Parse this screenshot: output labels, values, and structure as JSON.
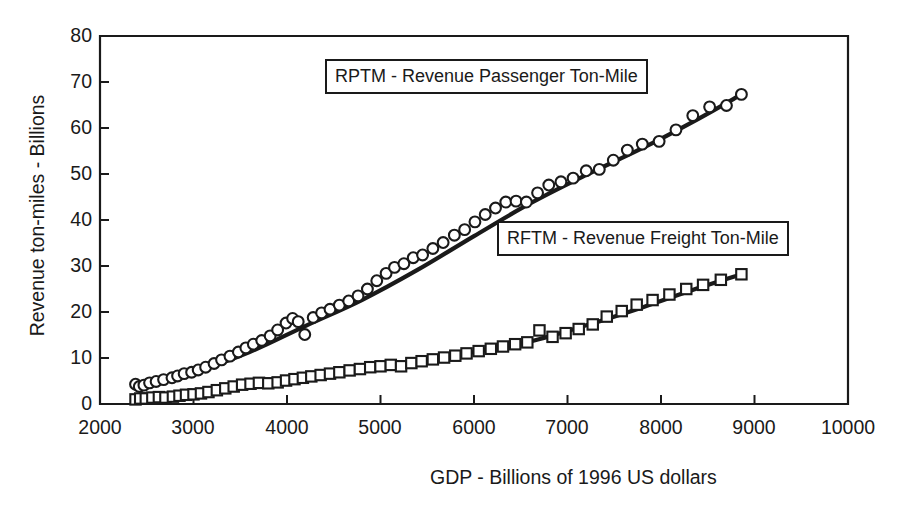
{
  "figure": {
    "ghost_title": "",
    "background": "#ffffff",
    "ink": "#1a1a1a"
  },
  "annotations": [
    {
      "id": "rptm",
      "text": "RPTM - Revenue Passenger Ton-Mile"
    },
    {
      "id": "rftm",
      "text": "RFTM - Revenue Freight Ton-Mile"
    }
  ],
  "chart_data": {
    "type": "scatter",
    "title": "",
    "xlabel": "GDP - Billions of 1996 US dollars",
    "ylabel": "Revenue ton-miles - Billions",
    "xlim": [
      2000,
      10000
    ],
    "ylim": [
      0,
      80
    ],
    "xticks": [
      2000,
      3000,
      4000,
      5000,
      6000,
      7000,
      8000,
      9000,
      10000
    ],
    "yticks": [
      0,
      10,
      20,
      30,
      40,
      50,
      60,
      70,
      80
    ],
    "grid": false,
    "legend_position": "inline-annotation-boxes",
    "marker_outline_color": "#1a1a1a",
    "fit_line_color": "#1a1a1a",
    "series": [
      {
        "name": "RPTM - Revenue Passenger Ton-Mile",
        "marker": "circle",
        "x": [
          2380,
          2420,
          2470,
          2530,
          2600,
          2680,
          2770,
          2830,
          2900,
          2980,
          3050,
          3130,
          3220,
          3300,
          3390,
          3480,
          3560,
          3640,
          3730,
          3820,
          3900,
          3990,
          4060,
          4120,
          4190,
          4280,
          4370,
          4460,
          4560,
          4660,
          4760,
          4860,
          4960,
          5060,
          5150,
          5250,
          5350,
          5450,
          5560,
          5670,
          5790,
          5900,
          6010,
          6120,
          6230,
          6340,
          6450,
          6560,
          6680,
          6800,
          6930,
          7060,
          7200,
          7340,
          7490,
          7640,
          7800,
          7980,
          8160,
          8340,
          8520,
          8700,
          8860
        ],
        "y": [
          4.3,
          3.8,
          4.1,
          4.6,
          4.9,
          5.3,
          5.7,
          6.1,
          6.6,
          6.9,
          7.4,
          8.0,
          8.8,
          9.6,
          10.4,
          11.3,
          12.2,
          13.0,
          13.8,
          14.8,
          16.1,
          17.6,
          18.6,
          17.9,
          15.1,
          18.8,
          19.8,
          20.6,
          21.5,
          22.4,
          23.5,
          25.0,
          26.8,
          28.4,
          29.7,
          30.5,
          31.8,
          32.4,
          33.8,
          35.1,
          36.7,
          37.9,
          39.6,
          41.2,
          42.6,
          43.9,
          44.1,
          43.9,
          45.9,
          47.6,
          48.3,
          49.1,
          50.7,
          51.0,
          53.0,
          55.2,
          56.5,
          57.1,
          59.6,
          62.7,
          64.6,
          64.9,
          67.3
        ],
        "fit_line": [
          [
            2380,
            4.0
          ],
          [
            3000,
            6.9
          ],
          [
            3600,
            11.3
          ],
          [
            4200,
            17.0
          ],
          [
            4800,
            22.6
          ],
          [
            5400,
            29.2
          ],
          [
            6000,
            36.5
          ],
          [
            6600,
            43.6
          ],
          [
            7200,
            49.8
          ],
          [
            7800,
            55.6
          ],
          [
            8400,
            62.0
          ],
          [
            8860,
            67.3
          ]
        ]
      },
      {
        "name": "RFTM - Revenue Freight Ton-Mile",
        "marker": "square",
        "x": [
          2380,
          2430,
          2490,
          2560,
          2630,
          2700,
          2780,
          2850,
          2920,
          3000,
          3080,
          3160,
          3250,
          3340,
          3430,
          3520,
          3610,
          3700,
          3800,
          3900,
          3990,
          4080,
          4170,
          4260,
          4360,
          4460,
          4560,
          4670,
          4780,
          4890,
          5000,
          5110,
          5220,
          5330,
          5440,
          5560,
          5680,
          5800,
          5920,
          6050,
          6180,
          6310,
          6440,
          6570,
          6700,
          6840,
          6980,
          7120,
          7270,
          7420,
          7580,
          7740,
          7910,
          8090,
          8270,
          8450,
          8640,
          8860
        ],
        "y": [
          1.0,
          1.2,
          1.2,
          1.4,
          1.5,
          1.4,
          1.6,
          1.8,
          2.0,
          2.1,
          2.3,
          2.6,
          3.0,
          3.4,
          3.8,
          4.2,
          4.4,
          4.6,
          4.5,
          4.7,
          5.1,
          5.4,
          5.7,
          6.0,
          6.3,
          6.6,
          6.9,
          7.3,
          7.6,
          8.0,
          8.2,
          8.5,
          8.2,
          8.9,
          9.3,
          9.7,
          10.1,
          10.5,
          11.0,
          11.5,
          12.0,
          12.5,
          13.0,
          13.4,
          16.0,
          14.6,
          15.4,
          16.3,
          17.3,
          19.0,
          20.2,
          21.6,
          22.6,
          23.8,
          25.0,
          25.9,
          27.0,
          28.2
        ],
        "fit_line": [
          [
            2380,
            1.1
          ],
          [
            3000,
            2.1
          ],
          [
            3600,
            4.0
          ],
          [
            4200,
            5.6
          ],
          [
            4800,
            7.2
          ],
          [
            5400,
            9.2
          ],
          [
            6000,
            11.3
          ],
          [
            6600,
            13.6
          ],
          [
            7200,
            17.1
          ],
          [
            7800,
            21.0
          ],
          [
            8400,
            25.2
          ],
          [
            8860,
            28.2
          ]
        ]
      }
    ]
  }
}
